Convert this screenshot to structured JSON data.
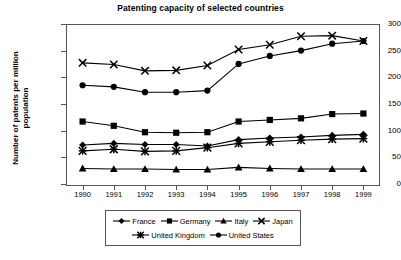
{
  "chart_data": {
    "type": "line",
    "title": "Patenting capacity of selected countries",
    "xlabel": "",
    "ylabel": "Number of patents per million population",
    "ylabel_line1": "Number of patents per million",
    "ylabel_line2": "population",
    "x": [
      "1990",
      "1991",
      "1992",
      "1993",
      "1994",
      "1995",
      "1996",
      "1997",
      "1998",
      "1999"
    ],
    "categories": [
      "1990",
      "1991",
      "1992",
      "1993",
      "1994",
      "1995",
      "1996",
      "1997",
      "1998",
      "1999"
    ],
    "ylim": [
      0,
      300
    ],
    "yticks": [
      0,
      50,
      100,
      150,
      200,
      250,
      300
    ],
    "grid": false,
    "legend_position": "bottom",
    "series": [
      {
        "name": "France",
        "marker": "diamond",
        "color": "#000000",
        "values": [
          75,
          78,
          76,
          76,
          73,
          85,
          88,
          90,
          93,
          95
        ]
      },
      {
        "name": "Germany",
        "marker": "square",
        "color": "#000000",
        "values": [
          119,
          111,
          99,
          98,
          99,
          119,
          122,
          125,
          133,
          134
        ]
      },
      {
        "name": "Italy",
        "marker": "triangle",
        "color": "#000000",
        "values": [
          31,
          30,
          30,
          29,
          29,
          33,
          31,
          30,
          30,
          30
        ]
      },
      {
        "name": "Japan",
        "marker": "cross",
        "color": "#000000",
        "values": [
          229,
          226,
          214,
          215,
          224,
          254,
          263,
          279,
          280,
          270
        ]
      },
      {
        "name": "United Kingdom",
        "marker": "star",
        "color": "#000000",
        "values": [
          64,
          67,
          63,
          64,
          70,
          78,
          81,
          84,
          86,
          87
        ]
      },
      {
        "name": "United States",
        "marker": "circle",
        "color": "#000000",
        "values": [
          187,
          184,
          174,
          174,
          177,
          227,
          242,
          252,
          265,
          270
        ]
      }
    ]
  },
  "legend": {
    "rows": [
      [
        "France",
        "Germany",
        "Italy",
        "Japan"
      ],
      [
        "United Kingdom",
        "United States"
      ]
    ]
  }
}
